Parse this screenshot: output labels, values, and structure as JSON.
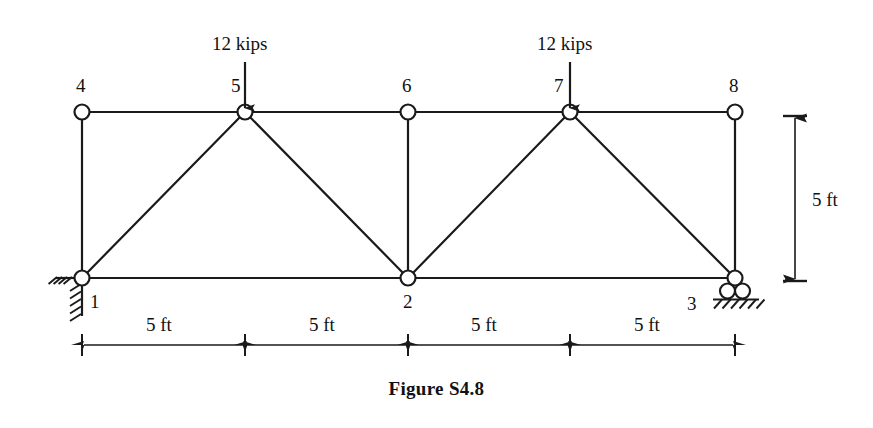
{
  "figure": {
    "caption": "Figure S4.8"
  },
  "diagram": {
    "type": "truss",
    "nodes": [
      {
        "id": "1",
        "label": "1",
        "x": 82,
        "y": 278,
        "chord": "bottom",
        "label_dx": 8,
        "label_dy": 14
      },
      {
        "id": "2",
        "label": "2",
        "x": 408,
        "y": 278,
        "chord": "bottom",
        "label_dx": -5,
        "label_dy": 14
      },
      {
        "id": "3",
        "label": "3",
        "x": 735,
        "y": 278,
        "chord": "bottom",
        "label_dx": -48,
        "label_dy": 16
      },
      {
        "id": "4",
        "label": "4",
        "x": 82,
        "y": 112,
        "chord": "top",
        "label_dx": -6,
        "label_dy": -36
      },
      {
        "id": "5",
        "label": "5",
        "x": 245,
        "y": 112,
        "chord": "top",
        "label_dx": -14,
        "label_dy": -36
      },
      {
        "id": "6",
        "label": "6",
        "x": 408,
        "y": 112,
        "chord": "top",
        "label_dx": -6,
        "label_dy": -36
      },
      {
        "id": "7",
        "label": "7",
        "x": 570,
        "y": 112,
        "chord": "top",
        "label_dx": -16,
        "label_dy": -36
      },
      {
        "id": "8",
        "label": "8",
        "x": 735,
        "y": 112,
        "chord": "top",
        "label_dx": -6,
        "label_dy": -36
      }
    ],
    "members": [
      {
        "from": "4",
        "to": "5",
        "kind": "top-chord"
      },
      {
        "from": "5",
        "to": "6",
        "kind": "top-chord"
      },
      {
        "from": "6",
        "to": "7",
        "kind": "top-chord"
      },
      {
        "from": "7",
        "to": "8",
        "kind": "top-chord"
      },
      {
        "from": "1",
        "to": "2",
        "kind": "bottom-chord"
      },
      {
        "from": "2",
        "to": "3",
        "kind": "bottom-chord"
      },
      {
        "from": "4",
        "to": "1",
        "kind": "vertical"
      },
      {
        "from": "6",
        "to": "2",
        "kind": "vertical"
      },
      {
        "from": "8",
        "to": "3",
        "kind": "vertical"
      },
      {
        "from": "1",
        "to": "5",
        "kind": "diagonal"
      },
      {
        "from": "5",
        "to": "2",
        "kind": "diagonal"
      },
      {
        "from": "2",
        "to": "7",
        "kind": "diagonal"
      },
      {
        "from": "7",
        "to": "3",
        "kind": "diagonal"
      }
    ],
    "loads": [
      {
        "at_node": "5",
        "label": "12 kips",
        "direction": "down",
        "arrow_x": 245,
        "arrow_top": 62,
        "arrow_bottom": 108,
        "label_x": 212,
        "label_y": 34
      },
      {
        "at_node": "7",
        "label": "12 kips",
        "direction": "down",
        "arrow_x": 570,
        "arrow_top": 62,
        "arrow_bottom": 108,
        "label_x": 537,
        "label_y": 34
      }
    ],
    "supports": [
      {
        "at_node": "1",
        "type": "pin",
        "hatch_side": "left-and-below"
      },
      {
        "at_node": "3",
        "type": "roller",
        "rollers": 2,
        "hatch_side": "below"
      }
    ],
    "dimensions": {
      "horizontal": [
        {
          "label": "5 ft",
          "from_x": 82,
          "to_x": 245,
          "label_x": 146,
          "label_y": 315
        },
        {
          "label": "5 ft",
          "from_x": 245,
          "to_x": 408,
          "label_x": 309,
          "label_y": 315
        },
        {
          "label": "5 ft",
          "from_x": 408,
          "to_x": 570,
          "label_x": 471,
          "label_y": 315
        },
        {
          "label": "5 ft",
          "from_x": 570,
          "to_x": 735,
          "label_x": 634,
          "label_y": 315
        }
      ],
      "horizontal_line_y": 345,
      "vertical": [
        {
          "label": "5 ft",
          "from_y": 116,
          "to_y": 281,
          "line_x": 795,
          "label_x": 812,
          "label_y": 190
        }
      ]
    }
  },
  "style": {
    "line_color": "#1a1a1a",
    "node_fill": "#ffffff",
    "background": "#ffffff"
  }
}
